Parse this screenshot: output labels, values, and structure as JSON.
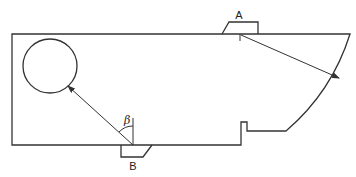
{
  "diagram": {
    "type": "ultrasonic test block schematic",
    "labels": {
      "probe_a": "A",
      "probe_b": "B",
      "angle": "β"
    },
    "stroke_color": "#333333",
    "background": "#ffffff",
    "elements": [
      {
        "name": "test-block",
        "description": "rectangular block with curved right end and small notch on bottom"
      },
      {
        "name": "circular-hole",
        "description": "circular reflector near top-left"
      },
      {
        "name": "probe-a",
        "description": "angled probe on top surface"
      },
      {
        "name": "probe-b",
        "description": "angled probe on bottom surface"
      },
      {
        "name": "beam-a",
        "description": "arrow from probe A to curved surface"
      },
      {
        "name": "beam-b",
        "description": "arrow from probe B to circular hole"
      },
      {
        "name": "angle-beta",
        "description": "refraction angle β measured from normal at probe B"
      }
    ]
  }
}
